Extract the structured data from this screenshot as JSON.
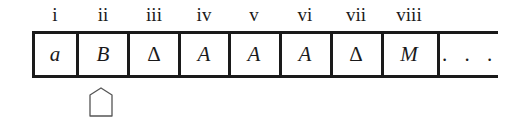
{
  "tape": {
    "cells": [
      {
        "index_label": "i",
        "symbol": "a",
        "italic": true
      },
      {
        "index_label": "ii",
        "symbol": "B",
        "italic": true
      },
      {
        "index_label": "iii",
        "symbol": "Δ",
        "italic": false
      },
      {
        "index_label": "iv",
        "symbol": "A",
        "italic": true
      },
      {
        "index_label": "v",
        "symbol": "A",
        "italic": true
      },
      {
        "index_label": "vi",
        "symbol": "A",
        "italic": true
      },
      {
        "index_label": "vii",
        "symbol": "Δ",
        "italic": false
      },
      {
        "index_label": "viii",
        "symbol": "M",
        "italic": true
      }
    ],
    "continuation": ". . ."
  },
  "head": {
    "position_cell": "ii",
    "icon": "tape-head-pointer-icon"
  }
}
